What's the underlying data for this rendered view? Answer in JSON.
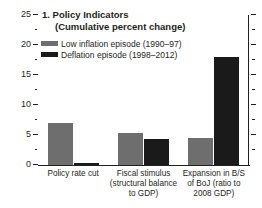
{
  "chart_data": {
    "type": "bar",
    "title": "1. Policy Indicators",
    "subtitle": "(Cumulative percent change)",
    "xlabel": "",
    "ylabel": "",
    "ylim": [
      0,
      25
    ],
    "yticks": [
      0,
      5,
      10,
      15,
      20,
      25
    ],
    "ytick_labels": [
      "0",
      "5",
      "10",
      "15",
      "20",
      "25"
    ],
    "yminor_ticks": [
      2.5,
      7.5,
      12.5,
      17.5,
      22.5
    ],
    "grid": false,
    "legend_position": "upper-left",
    "categories": [
      "Policy rate cut",
      "Fiscal stimulus (structural balance to GDP)",
      "Expansion in B/S of BoJ (ratio to 2008 GDP)"
    ],
    "category_lines": [
      [
        "Policy rate cut"
      ],
      [
        "Fiscal stimulus",
        "(structural balance",
        "to GDP)"
      ],
      [
        "Expansion in B/S",
        "of BoJ (ratio to",
        "2008 GDP)"
      ]
    ],
    "series": [
      {
        "name": "Low inflation episode (1990–97)",
        "color": "#6e6e6e",
        "values": [
          7.0,
          5.4,
          4.5
        ]
      },
      {
        "name": "Deflation episode (1998–2012)",
        "color": "#1a1a1a",
        "values": [
          0.3,
          4.3,
          18.0
        ]
      }
    ]
  },
  "colors": {
    "series_low_inflation": "#6e6e6e",
    "series_deflation": "#1a1a1a",
    "axis": "#231f20",
    "background": "#ffffff"
  }
}
